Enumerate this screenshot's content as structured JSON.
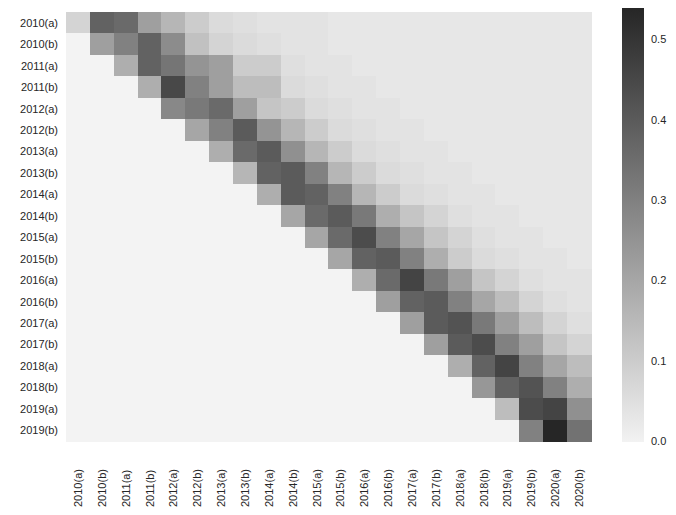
{
  "chart_data": {
    "type": "heatmap",
    "title": "",
    "xlabel": "",
    "ylabel": "",
    "rows": [
      "2010(a)",
      "2010(b)",
      "2011(a)",
      "2011(b)",
      "2012(a)",
      "2012(b)",
      "2013(a)",
      "2013(b)",
      "2014(a)",
      "2014(b)",
      "2015(a)",
      "2015(b)",
      "2016(a)",
      "2016(b)",
      "2017(a)",
      "2017(b)",
      "2018(a)",
      "2018(b)",
      "2019(a)",
      "2019(b)"
    ],
    "columns": [
      "2010(a)",
      "2010(b)",
      "2011(a)",
      "2011(b)",
      "2012(a)",
      "2012(b)",
      "2013(a)",
      "2013(b)",
      "2014(a)",
      "2014(b)",
      "2015(a)",
      "2015(b)",
      "2016(a)",
      "2016(b)",
      "2017(a)",
      "2017(b)",
      "2018(a)",
      "2018(b)",
      "2019(a)",
      "2019(b)",
      "2020(a)",
      "2020(b)"
    ],
    "colormap": "Greys",
    "vmin": 0.0,
    "vmax": 0.54,
    "colorbar_ticks": [
      0.0,
      0.1,
      0.2,
      0.3,
      0.4,
      0.5
    ],
    "lower_triangle_masked": true,
    "values": [
      [
        0.08,
        0.38,
        0.36,
        0.22,
        0.16,
        0.1,
        0.06,
        0.05,
        0.04,
        0.04,
        0.04,
        0.03,
        0.03,
        0.03,
        0.03,
        0.03,
        0.03,
        0.03,
        0.03,
        0.03,
        0.03,
        0.03
      ],
      [
        null,
        0.22,
        0.3,
        0.38,
        0.27,
        0.13,
        0.08,
        0.06,
        0.05,
        0.04,
        0.04,
        0.03,
        0.03,
        0.03,
        0.03,
        0.03,
        0.03,
        0.03,
        0.03,
        0.03,
        0.03,
        0.03
      ],
      [
        null,
        null,
        0.18,
        0.38,
        0.33,
        0.25,
        0.22,
        0.1,
        0.1,
        0.05,
        0.04,
        0.04,
        0.03,
        0.03,
        0.03,
        0.03,
        0.03,
        0.03,
        0.03,
        0.03,
        0.03,
        0.03
      ],
      [
        null,
        null,
        null,
        0.18,
        0.45,
        0.3,
        0.22,
        0.14,
        0.14,
        0.06,
        0.05,
        0.04,
        0.04,
        0.03,
        0.03,
        0.03,
        0.03,
        0.03,
        0.03,
        0.03,
        0.03,
        0.03
      ],
      [
        null,
        null,
        null,
        null,
        0.28,
        0.32,
        0.36,
        0.22,
        0.12,
        0.1,
        0.06,
        0.05,
        0.04,
        0.04,
        0.03,
        0.03,
        0.03,
        0.03,
        0.03,
        0.03,
        0.03,
        0.03
      ],
      [
        null,
        null,
        null,
        null,
        null,
        0.2,
        0.3,
        0.4,
        0.25,
        0.16,
        0.1,
        0.06,
        0.05,
        0.04,
        0.04,
        0.03,
        0.03,
        0.03,
        0.03,
        0.03,
        0.03,
        0.03
      ],
      [
        null,
        null,
        null,
        null,
        null,
        null,
        0.18,
        0.36,
        0.4,
        0.26,
        0.16,
        0.1,
        0.06,
        0.05,
        0.04,
        0.04,
        0.03,
        0.03,
        0.03,
        0.03,
        0.03,
        0.03
      ],
      [
        null,
        null,
        null,
        null,
        null,
        null,
        null,
        0.16,
        0.38,
        0.4,
        0.3,
        0.16,
        0.1,
        0.06,
        0.05,
        0.04,
        0.04,
        0.03,
        0.03,
        0.03,
        0.03,
        0.03
      ],
      [
        null,
        null,
        null,
        null,
        null,
        null,
        null,
        null,
        0.18,
        0.4,
        0.38,
        0.3,
        0.16,
        0.1,
        0.06,
        0.05,
        0.04,
        0.04,
        0.03,
        0.03,
        0.03,
        0.03
      ],
      [
        null,
        null,
        null,
        null,
        null,
        null,
        null,
        null,
        null,
        0.2,
        0.36,
        0.4,
        0.32,
        0.18,
        0.12,
        0.08,
        0.05,
        0.04,
        0.04,
        0.03,
        0.03,
        0.03
      ],
      [
        null,
        null,
        null,
        null,
        null,
        null,
        null,
        null,
        null,
        null,
        0.2,
        0.36,
        0.44,
        0.3,
        0.2,
        0.12,
        0.08,
        0.05,
        0.04,
        0.04,
        0.03,
        0.03
      ],
      [
        null,
        null,
        null,
        null,
        null,
        null,
        null,
        null,
        null,
        null,
        null,
        0.2,
        0.38,
        0.4,
        0.3,
        0.18,
        0.1,
        0.06,
        0.05,
        0.04,
        0.04,
        0.03
      ],
      [
        null,
        null,
        null,
        null,
        null,
        null,
        null,
        null,
        null,
        null,
        null,
        null,
        0.18,
        0.36,
        0.46,
        0.32,
        0.22,
        0.12,
        0.08,
        0.05,
        0.04,
        0.04
      ],
      [
        null,
        null,
        null,
        null,
        null,
        null,
        null,
        null,
        null,
        null,
        null,
        null,
        null,
        0.22,
        0.38,
        0.4,
        0.3,
        0.2,
        0.14,
        0.08,
        0.05,
        0.04
      ],
      [
        null,
        null,
        null,
        null,
        null,
        null,
        null,
        null,
        null,
        null,
        null,
        null,
        null,
        null,
        0.22,
        0.4,
        0.42,
        0.32,
        0.22,
        0.14,
        0.08,
        0.05
      ],
      [
        null,
        null,
        null,
        null,
        null,
        null,
        null,
        null,
        null,
        null,
        null,
        null,
        null,
        null,
        null,
        0.22,
        0.4,
        0.44,
        0.3,
        0.22,
        0.12,
        0.08
      ],
      [
        null,
        null,
        null,
        null,
        null,
        null,
        null,
        null,
        null,
        null,
        null,
        null,
        null,
        null,
        null,
        null,
        0.18,
        0.38,
        0.46,
        0.3,
        0.2,
        0.14
      ],
      [
        null,
        null,
        null,
        null,
        null,
        null,
        null,
        null,
        null,
        null,
        null,
        null,
        null,
        null,
        null,
        null,
        null,
        0.24,
        0.38,
        0.42,
        0.3,
        0.18
      ],
      [
        null,
        null,
        null,
        null,
        null,
        null,
        null,
        null,
        null,
        null,
        null,
        null,
        null,
        null,
        null,
        null,
        null,
        null,
        0.14,
        0.44,
        0.46,
        0.26
      ],
      [
        null,
        null,
        null,
        null,
        null,
        null,
        null,
        null,
        null,
        null,
        null,
        null,
        null,
        null,
        null,
        null,
        null,
        null,
        null,
        0.3,
        0.54,
        0.34
      ]
    ]
  },
  "layout": {
    "grid_left": 66,
    "grid_top": 12,
    "cell_w": 23.86,
    "cell_h": 21.45,
    "cbar_top": 8,
    "cbar_bottom": 442
  }
}
